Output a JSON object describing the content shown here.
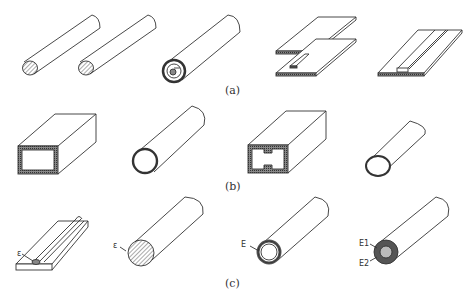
{
  "figure": {
    "row_labels": [
      "(a)",
      "(b)",
      "(c)"
    ],
    "row_a": {
      "items": [
        "solid-rod-1",
        "solid-rod-2",
        "coaxial-rod",
        "stacked-plates-with-strip",
        "plate-with-embedded-strip"
      ]
    },
    "row_b": {
      "items": [
        "rectangular-tube",
        "round-tube",
        "rectangular-tube-with-ridges",
        "thin-round-tube"
      ]
    },
    "row_c": {
      "items": [
        "plate-with-groove",
        "solid-cylinder",
        "hollow-tube",
        "layered-cylinder"
      ],
      "annotations": {
        "plate": "ε",
        "cylinder": "ε",
        "tube": "E",
        "layered_outer": "E1",
        "layered_inner": "E2"
      }
    }
  }
}
